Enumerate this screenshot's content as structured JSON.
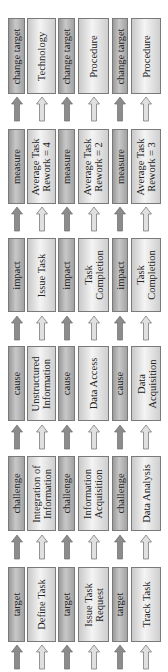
{
  "diagram": {
    "orientation": "rotated-90-ccw",
    "stages": [
      "target",
      "challenge",
      "cause",
      "impact",
      "measure",
      "change target"
    ],
    "columns": [
      {
        "name": "chain-1",
        "nodes": [
          {
            "stage": "target",
            "value": "Define Task"
          },
          {
            "stage": "challenge",
            "value": "Integration of Information"
          },
          {
            "stage": "cause",
            "value": "Unstructured Information"
          },
          {
            "stage": "impact",
            "value": "Issue Task"
          },
          {
            "stage": "measure",
            "value": "Average Task Rework = 4"
          },
          {
            "stage": "change target",
            "value": "Technology"
          }
        ]
      },
      {
        "name": "chain-2",
        "nodes": [
          {
            "stage": "target",
            "value": "Issue Task Request"
          },
          {
            "stage": "challenge",
            "value": "Information Acquisition"
          },
          {
            "stage": "cause",
            "value": "Data Access"
          },
          {
            "stage": "impact",
            "value": "Task Completion"
          },
          {
            "stage": "measure",
            "value": "Average Task Rework = 2"
          },
          {
            "stage": "change target",
            "value": "Procedure"
          }
        ]
      },
      {
        "name": "chain-3",
        "nodes": [
          {
            "stage": "target",
            "value": "Track Task"
          },
          {
            "stage": "challenge",
            "value": "Data Analysis"
          },
          {
            "stage": "cause",
            "value": "Data Acquisition"
          },
          {
            "stage": "impact",
            "value": "Task Completion"
          },
          {
            "stage": "measure",
            "value": "Average Task Rework = 3"
          },
          {
            "stage": "change target",
            "value": "Procedure"
          }
        ]
      }
    ],
    "labels": {
      "r0": {
        "c0a": "change target",
        "c0b": "Technology",
        "c1a": "change target",
        "c1b": "Procedure",
        "c2a": "change target",
        "c2b": "Procedure"
      },
      "r1": {
        "c0a": "measure",
        "c0b1": "Average Task",
        "c0b2": "Rework = 4",
        "c1a": "measure",
        "c1b1": "Average Task",
        "c1b2": "Rework = 2",
        "c2a": "measure",
        "c2b1": "Average Task",
        "c2b2": "Rework = 3"
      },
      "r2": {
        "c0a": "impact",
        "c0b": "Issue Task",
        "c1a": "impact",
        "c1b1": "Task",
        "c1b2": "Completion",
        "c2a": "impact",
        "c2b1": "Task",
        "c2b2": "Completion"
      },
      "r3": {
        "c0a": "cause",
        "c0b1": "Unstructured",
        "c0b2": "Information",
        "c1a": "cause",
        "c1b": "Data Access",
        "c2a": "cause",
        "c2b1": "Data",
        "c2b2": "Acquisition"
      },
      "r4": {
        "c0a": "challenge",
        "c0b1": "Integration of",
        "c0b2": "Information",
        "c1a": "challenge",
        "c1b1": "Information",
        "c1b2": "Acquisition",
        "c2a": "challenge",
        "c2b": "Data Analysis"
      },
      "r5": {
        "c0a": "target",
        "c0b": "Define Task",
        "c1a": "target",
        "c1b1": "Issue Task",
        "c1b2": "Request",
        "c2a": "target",
        "c2b": "Track Task"
      }
    },
    "colors": {
      "dark_box": "#b0b0b0",
      "light_box": "#e6e6e6",
      "border": "#7a7a7a",
      "dark_arrow": "#8c8c8c",
      "light_arrow": "#e0e0e0"
    }
  }
}
